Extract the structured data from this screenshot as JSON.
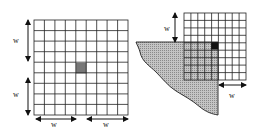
{
  "figure": {
    "left_panel": {
      "grid": {
        "cols": 9,
        "rows": 9,
        "highlight_cell": {
          "col": 4,
          "row": 4,
          "color": "#777777"
        }
      },
      "labels": {
        "w_upper": "w",
        "w_lower": "w",
        "w_bottom_left": "w",
        "w_bottom_right": "w"
      }
    },
    "right_panel": {
      "grid": {
        "cols": 9,
        "rows": 9,
        "highlight_cell": {
          "col": 4,
          "row": 4,
          "color": "#111111"
        }
      },
      "region_fill": "#b8b8b8",
      "labels": {
        "w_top": "w",
        "w_bottom": "w"
      }
    }
  }
}
